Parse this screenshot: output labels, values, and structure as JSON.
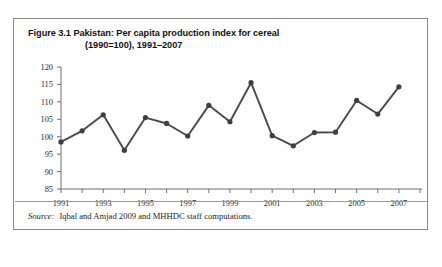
{
  "figure": {
    "title_line1": "Figure 3.1 Pakistan: Per capita production index for cereal",
    "title_line2": "(1990=100), 1991–2007",
    "source_label": "Source:",
    "source_text": "Iqbal and Amjad 2009 and MHHDC staff computations."
  },
  "chart_data": {
    "type": "line",
    "title": "Figure 3.1 Pakistan: Per capita production index for cereal (1990=100), 1991–2007",
    "xlabel": "",
    "ylabel": "",
    "x": [
      1991,
      1992,
      1993,
      1994,
      1995,
      1996,
      1997,
      1998,
      1999,
      2000,
      2001,
      2002,
      2003,
      2004,
      2005,
      2006,
      2007
    ],
    "values": [
      98.5,
      101.7,
      106.3,
      96.1,
      105.5,
      103.8,
      100.2,
      109.0,
      104.3,
      115.5,
      100.3,
      97.4,
      101.2,
      101.3,
      110.4,
      106.5,
      114.3
    ],
    "series": [
      {
        "name": "Per capita production index for cereal (1990=100)",
        "values": [
          98.5,
          101.7,
          106.3,
          96.1,
          105.5,
          103.8,
          100.2,
          109.0,
          104.3,
          115.5,
          100.3,
          97.4,
          101.2,
          101.3,
          110.4,
          106.5,
          114.3
        ]
      }
    ],
    "ylim": [
      85,
      120
    ],
    "xlim": [
      1991,
      2008
    ],
    "ytick_labels": [
      "85",
      "90",
      "95",
      "100",
      "105",
      "110",
      "115",
      "120"
    ],
    "ytick_values": [
      85,
      90,
      95,
      100,
      105,
      110,
      115,
      120
    ],
    "xtick_values": [
      1991,
      1992,
      1993,
      1994,
      1995,
      1996,
      1997,
      1998,
      1999,
      2000,
      2001,
      2002,
      2003,
      2004,
      2005,
      2006,
      2007,
      2008
    ],
    "xtick_labels": [
      "1991",
      "",
      "1993",
      "",
      "1995",
      "",
      "1997",
      "",
      "1999",
      "",
      "2001",
      "",
      "2003",
      "",
      "2005",
      "",
      "2007",
      ""
    ],
    "grid": false,
    "legend": "none",
    "line_color": "#4a4a4a",
    "marker_color": "#3f3f3f",
    "marker": "circle",
    "axis_color": "#6f6f6f"
  }
}
